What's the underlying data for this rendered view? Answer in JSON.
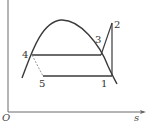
{
  "diagram": {
    "type": "T-s diagram (vapor-compression refrigeration cycle)",
    "colors": {
      "line": "#3a3a3a",
      "axis": "#6a6a6a",
      "dashed": "#8a8a8a"
    },
    "axes": {
      "origin_label": "O",
      "x_label": "s"
    },
    "points": [
      {
        "id": "1",
        "label": "1"
      },
      {
        "id": "2",
        "label": "2"
      },
      {
        "id": "3",
        "label": "3"
      },
      {
        "id": "4",
        "label": "4"
      },
      {
        "id": "5",
        "label": "5"
      }
    ],
    "edges": [
      {
        "from": "1",
        "to": "2",
        "style": "solid"
      },
      {
        "from": "2",
        "to": "3",
        "style": "solid"
      },
      {
        "from": "3",
        "to": "4",
        "style": "solid"
      },
      {
        "from": "4",
        "to": "5",
        "style": "dashed"
      },
      {
        "from": "5",
        "to": "1",
        "style": "solid"
      }
    ]
  }
}
